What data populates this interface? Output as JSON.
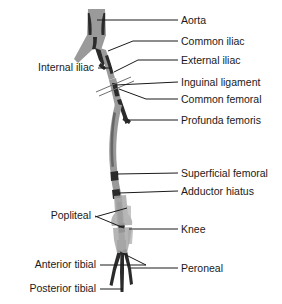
{
  "figure": {
    "background_color": "#ffffff",
    "vessel_color": "#9a9a9a",
    "vessel_shadow_color": "#2b2b2b",
    "bone_color": "#a8a8a8",
    "leader_color": "#1a1a1a",
    "text_color": "#1a1a1a"
  },
  "labels_right": [
    {
      "id": "aorta",
      "text": "Aorta",
      "x": 181,
      "y": 24
    },
    {
      "id": "common-iliac",
      "text": "Common iliac",
      "x": 181,
      "y": 45
    },
    {
      "id": "external-iliac",
      "text": "External iliac",
      "x": 181,
      "y": 64
    },
    {
      "id": "inguinal-ligament",
      "text": "Inguinal ligament",
      "x": 181,
      "y": 86
    },
    {
      "id": "common-femoral",
      "text": "Common femoral",
      "x": 181,
      "y": 103
    },
    {
      "id": "profunda-femoris",
      "text": "Profunda femoris",
      "x": 181,
      "y": 124
    },
    {
      "id": "superficial-femoral",
      "text": "Superficial femoral",
      "x": 181,
      "y": 177
    },
    {
      "id": "adductor-hiatus",
      "text": "Adductor hiatus",
      "x": 181,
      "y": 195
    },
    {
      "id": "knee",
      "text": "Knee",
      "x": 181,
      "y": 233
    },
    {
      "id": "peroneal",
      "text": "Peroneal",
      "x": 181,
      "y": 272
    }
  ],
  "labels_left": [
    {
      "id": "internal-iliac",
      "text": "Internal iliac",
      "x": 94,
      "y": 71
    },
    {
      "id": "popliteal",
      "text": "Popliteal",
      "x": 91,
      "y": 219
    },
    {
      "id": "anterior-tibial",
      "text": "Anterior tibial",
      "x": 96,
      "y": 268
    },
    {
      "id": "posterior-tibial",
      "text": "Posterior tibial",
      "x": 96,
      "y": 292
    }
  ]
}
